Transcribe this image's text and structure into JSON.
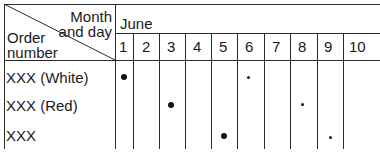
{
  "table": {
    "corner_header": {
      "top_right_line1": "Month",
      "top_right_line2": "and day",
      "bottom_left_line1": "Order",
      "bottom_left_line2": "number"
    },
    "month": "June",
    "days": [
      "1",
      "2",
      "3",
      "4",
      "5",
      "6",
      "7",
      "8",
      "9",
      "10"
    ],
    "rows": [
      {
        "label": "XXX (White)",
        "large_dot_day": "1",
        "small_dot_day": "6"
      },
      {
        "label": "XXX (Red)",
        "large_dot_day": "3",
        "small_dot_day": "8"
      },
      {
        "label": "XXX",
        "large_dot_day": "5",
        "small_dot_day": "9"
      }
    ]
  }
}
